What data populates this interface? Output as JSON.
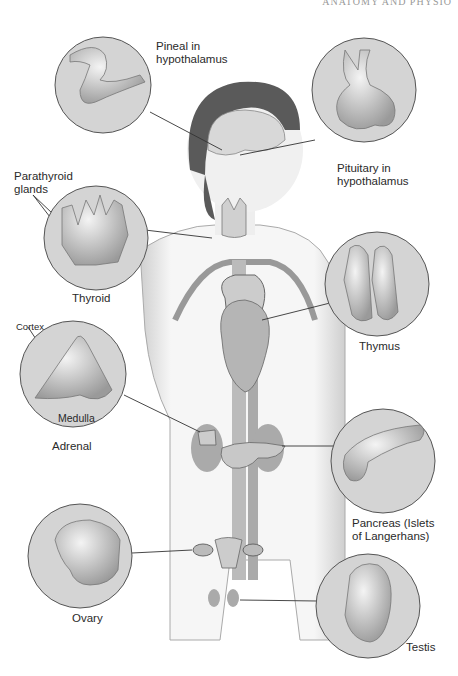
{
  "header": {
    "running_head": "ANATOMY AND PHYSIO"
  },
  "diagram": {
    "labels": {
      "pineal": "Pineal in\nhypothalamus",
      "pituitary": "Pituitary in\nhypothalamus",
      "parathyroid": "Parathyroid\nglands",
      "thyroid": "Thyroid",
      "thymus": "Thymus",
      "cortex": "Cortex",
      "medulla": "Medulla",
      "adrenal": "Adrenal",
      "pancreas": "Pancreas (Islets\nof Langerhans)",
      "ovary": "Ovary",
      "testis": "Testis"
    },
    "colors": {
      "circle_fill": "#d4d4d4",
      "circle_stroke": "#555555",
      "organ": "#bdbdbd",
      "skin": "#f2f2f2",
      "hair": "#5a5a5a"
    }
  }
}
